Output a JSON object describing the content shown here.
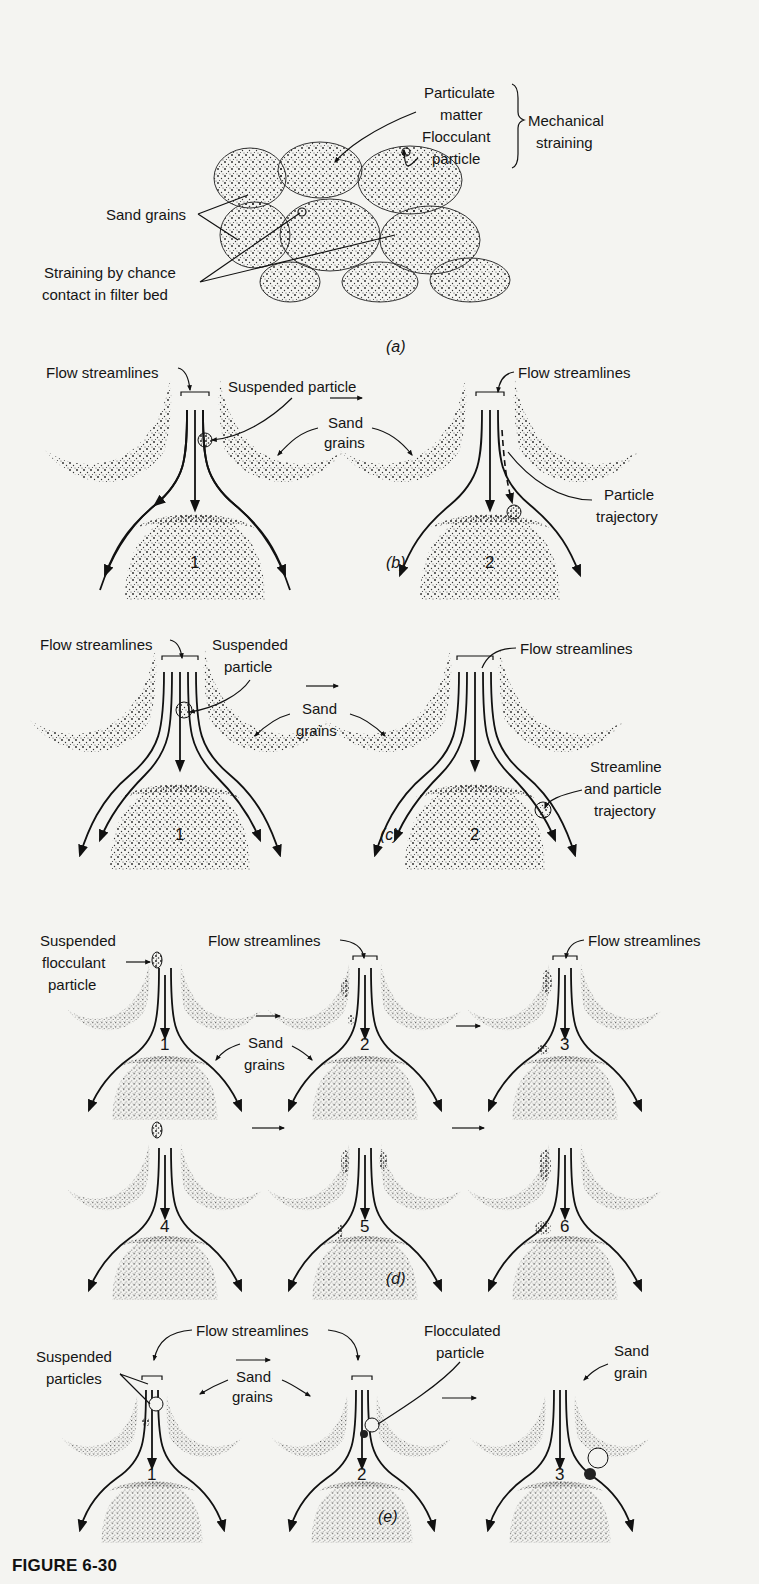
{
  "figure": {
    "id": "FIGURE 6-30",
    "panels": [
      {
        "key": "a",
        "caption": "(a)",
        "labels": {
          "particulate_matter": "Particulate matter",
          "flocculant_particle": "Flocculant particle",
          "mechanical_straining": "Mechanical straining",
          "sand_grains": "Sand grains",
          "straining_by_chance": "Straining by chance contact in filter bed"
        }
      },
      {
        "key": "b",
        "caption": "(b)",
        "labels": {
          "flow_streamlines_left": "Flow streamlines",
          "suspended_particle": "Suspended particle",
          "sand_grains": "Sand grains",
          "flow_streamlines_right": "Flow streamlines",
          "particle_trajectory": "Particle trajectory"
        },
        "numbers": [
          "1",
          "2"
        ]
      },
      {
        "key": "c",
        "caption": "(c)",
        "labels": {
          "flow_streamlines_left": "Flow streamlines",
          "suspended_particle": "Suspended particle",
          "sand_grains": "Sand grains",
          "flow_streamlines_right": "Flow streamlines",
          "streamline_and_particle_trajectory": "Streamline and particle trajectory"
        },
        "numbers": [
          "1",
          "2"
        ]
      },
      {
        "key": "d",
        "caption": "(d)",
        "labels": {
          "suspended_flocculant_particle": "Suspended flocculant particle",
          "flow_streamlines_mid": "Flow streamlines",
          "flow_streamlines_right": "Flow streamlines",
          "sand_grains": "Sand grains"
        },
        "numbers": [
          "1",
          "2",
          "3",
          "4",
          "5",
          "6"
        ]
      },
      {
        "key": "e",
        "caption": "(e)",
        "labels": {
          "flow_streamlines": "Flow streamlines",
          "suspended_particles": "Suspended particles",
          "sand_grains": "Sand grains",
          "flocculated_particle": "Flocculated particle",
          "sand_grain": "Sand grain"
        },
        "numbers": [
          "1",
          "2",
          "3"
        ]
      }
    ]
  },
  "text": {
    "a_particulate_1": "Particulate",
    "a_particulate_2": "matter",
    "a_flocculant_1": "Flocculant",
    "a_flocculant_2": "particle",
    "a_mech_1": "Mechanical",
    "a_mech_2": "straining",
    "a_sand": "Sand grains",
    "a_strain_1": "Straining by chance",
    "a_strain_2": "contact in filter bed",
    "cap_a": "(a)",
    "b_flow_left": "Flow streamlines",
    "b_susp": "Suspended particle",
    "b_sand_1": "Sand",
    "b_sand_2": "grains",
    "b_flow_right": "Flow streamlines",
    "b_traj_1": "Particle",
    "b_traj_2": "trajectory",
    "b_n1": "1",
    "b_n2": "2",
    "cap_b": "(b)",
    "c_flow_left": "Flow streamlines",
    "c_susp_1": "Suspended",
    "c_susp_2": "particle",
    "c_sand_1": "Sand",
    "c_sand_2": "grains",
    "c_flow_right": "Flow streamlines",
    "c_traj_1": "Streamline",
    "c_traj_2": "and particle",
    "c_traj_3": "trajectory",
    "c_n1": "1",
    "c_n2": "2",
    "cap_c": "(c)",
    "d_susp_1": "Suspended",
    "d_susp_2": "flocculant",
    "d_susp_3": "particle",
    "d_flow_mid": "Flow streamlines",
    "d_flow_right": "Flow streamlines",
    "d_sand_1": "Sand",
    "d_sand_2": "grains",
    "d_n1": "1",
    "d_n2": "2",
    "d_n3": "3",
    "d_n4": "4",
    "d_n5": "5",
    "d_n6": "6",
    "cap_d": "(d)",
    "e_flow": "Flow streamlines",
    "e_susp_1": "Suspended",
    "e_susp_2": "particles",
    "e_sand_1": "Sand",
    "e_sand_2": "grains",
    "e_floc_1": "Flocculated",
    "e_floc_2": "particle",
    "e_grain_1": "Sand",
    "e_grain_2": "grain",
    "e_n1": "1",
    "e_n2": "2",
    "e_n3": "3",
    "cap_e": "(e)",
    "figure_label": "FIGURE 6-30"
  },
  "colors": {
    "background": "#f4f4f1",
    "ink": "#111111",
    "stipple": "#2a2a2a"
  }
}
